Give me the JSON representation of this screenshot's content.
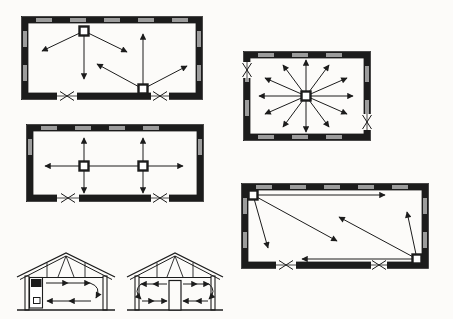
{
  "figure": {
    "background": "#fcfbf9",
    "ink": "#1c1c1c",
    "window_color": "#9c9c9c",
    "mask": "#fcfbf9",
    "device_fill": "#ffffff"
  },
  "floor_plans": [
    {
      "id": "floor-plan-two-units-staggered",
      "rect": [
        22,
        17,
        180,
        82
      ],
      "wall_thickness": 6,
      "windows": {
        "top": true,
        "left": true,
        "right": true,
        "bottom": false
      },
      "doors": [
        {
          "side": "bottom",
          "center": 67,
          "width": 20
        },
        {
          "side": "bottom",
          "center": 160,
          "width": 18
        }
      ],
      "devices": [
        [
          84,
          31
        ],
        [
          143,
          89
        ]
      ],
      "arrows": [
        [
          84,
          31,
          42,
          51
        ],
        [
          84,
          31,
          84,
          79
        ],
        [
          84,
          31,
          127,
          52
        ],
        [
          143,
          89,
          97,
          64
        ],
        [
          143,
          89,
          143,
          34
        ],
        [
          143,
          89,
          187,
          66
        ]
      ],
      "lines": []
    },
    {
      "id": "floor-plan-two-units-inline",
      "rect": [
        27,
        125,
        176,
        76
      ],
      "wall_thickness": 6,
      "windows": {
        "top": true,
        "left": true,
        "right": true,
        "bottom": false
      },
      "doors": [
        {
          "side": "bottom",
          "center": 68,
          "width": 22
        },
        {
          "side": "bottom",
          "center": 160,
          "width": 18
        }
      ],
      "devices": [
        [
          84,
          166
        ],
        [
          143,
          166
        ]
      ],
      "arrows": [
        [
          84,
          166,
          84,
          138
        ],
        [
          84,
          166,
          84,
          193
        ],
        [
          143,
          166,
          143,
          138
        ],
        [
          143,
          166,
          143,
          193
        ],
        [
          84,
          166,
          45,
          166
        ],
        [
          143,
          166,
          183,
          166
        ]
      ],
      "lines": [
        [
          84,
          166,
          143,
          166
        ]
      ]
    },
    {
      "id": "floor-plan-central-unit-radial",
      "rect": [
        244,
        52,
        126,
        88
      ],
      "wall_thickness": 6,
      "windows": {
        "top": true,
        "left": true,
        "right": true,
        "bottom": true
      },
      "doors": [
        {
          "side": "left",
          "center": 70,
          "width": 16
        },
        {
          "side": "right",
          "center": 122,
          "width": 16
        }
      ],
      "devices": [
        [
          306,
          96
        ]
      ],
      "arrows": [
        [
          306,
          96,
          353,
          96
        ],
        [
          306,
          96,
          347,
          78
        ],
        [
          306,
          96,
          329,
          65
        ],
        [
          306,
          96,
          306,
          60
        ],
        [
          306,
          96,
          283,
          65
        ],
        [
          306,
          96,
          265,
          78
        ],
        [
          306,
          96,
          259,
          96
        ],
        [
          306,
          96,
          265,
          114
        ],
        [
          306,
          96,
          283,
          127
        ],
        [
          306,
          96,
          306,
          132
        ],
        [
          306,
          96,
          329,
          127
        ],
        [
          306,
          96,
          347,
          114
        ]
      ],
      "lines": []
    },
    {
      "id": "floor-plan-corner-units-diagonal",
      "rect": [
        242,
        184,
        186,
        84
      ],
      "wall_thickness": 6,
      "windows": {
        "top": true,
        "left": true,
        "right": true,
        "bottom": false
      },
      "doors": [
        {
          "side": "bottom",
          "center": 286,
          "width": 20
        },
        {
          "side": "bottom",
          "center": 379,
          "width": 16
        }
      ],
      "devices": [
        [
          253,
          195
        ],
        [
          417,
          259
        ]
      ],
      "arrows": [
        [
          253,
          195,
          385,
          195
        ],
        [
          253,
          195,
          268,
          248
        ],
        [
          253,
          195,
          337,
          241
        ],
        [
          417,
          259,
          302,
          259
        ],
        [
          417,
          259,
          339,
          217
        ],
        [
          417,
          259,
          407,
          212
        ]
      ],
      "lines": []
    }
  ],
  "cross_sections": [
    {
      "id": "section-wall-mounted-unit",
      "ground": [
        17,
        310,
        115,
        310
      ],
      "walls": [
        [
          25,
          276,
          4,
          34
        ],
        [
          103,
          276,
          4,
          34
        ]
      ],
      "roof": {
        "outer": "M17,277 L66,253 L115,277",
        "inner": "M20,279.5 L66,256 L112,279.5",
        "chord": [
          29,
          277.5,
          103,
          277.5
        ],
        "web": [
          "M47,277 L47,262.5",
          "M85,277 L85,262.5",
          "M58,277 L66,256",
          "M74,277 L66,256"
        ]
      },
      "unit": {
        "body": [
          29.5,
          277.5,
          13,
          30.5
        ],
        "grille": [
          31,
          279,
          10.5,
          8
        ],
        "inlet": [
          33.5,
          297.5,
          6.5,
          6
        ]
      },
      "flow_arrows": [
        [
          46,
          283,
          68,
          283
        ],
        [
          68,
          283,
          90,
          283
        ],
        [
          91,
          301,
          69,
          301
        ],
        [
          69,
          301,
          47,
          301
        ]
      ],
      "flow_arcs": [
        "M90,283 Q102,287 96,298"
      ]
    },
    {
      "id": "section-central-duct",
      "ground": [
        127,
        310,
        223,
        310
      ],
      "walls": [
        [
          135,
          276,
          4,
          34
        ],
        [
          211,
          276,
          4,
          34
        ]
      ],
      "roof": {
        "outer": "M127,277 L175,253 L223,277",
        "inner": "M130,279.5 L175,256 L220,279.5",
        "chord": [
          139,
          277.5,
          211,
          277.5
        ],
        "web": [
          "M157,277 L157,262.5",
          "M193,277 L193,262.5",
          "M167,277 L175,256",
          "M183,277 L175,256"
        ]
      },
      "duct": [
        169,
        280.5,
        12,
        29.5
      ],
      "flow_arrows": [
        [
          167,
          284,
          153,
          284
        ],
        [
          153,
          284,
          141,
          284
        ],
        [
          142,
          301,
          154,
          301
        ],
        [
          154,
          301,
          167,
          301
        ],
        [
          183,
          284,
          197,
          284
        ],
        [
          197,
          284,
          209,
          284
        ],
        [
          208,
          301,
          196,
          301
        ],
        [
          196,
          301,
          183,
          301
        ]
      ],
      "flow_arcs": [
        "M141,284 Q133,291 141,299",
        "M209,284 Q217,291 209,299"
      ]
    }
  ]
}
